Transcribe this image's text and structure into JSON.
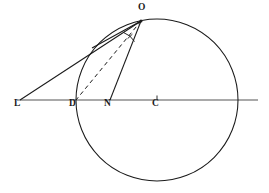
{
  "figure": {
    "width": 269,
    "height": 193,
    "background_color": "#ffffff",
    "stroke_color": "#1a1a1a",
    "axis_color": "#555555"
  },
  "labels": {
    "L": "L",
    "D": "D",
    "N": "N",
    "C": "C",
    "O": "O"
  },
  "geometry": {
    "circle": {
      "cx": 157,
      "cy": 100,
      "r": 81
    },
    "points": {
      "L": {
        "x": 20,
        "y": 100
      },
      "D": {
        "x": 76,
        "y": 100
      },
      "N": {
        "x": 110,
        "y": 100
      },
      "C": {
        "x": 157,
        "y": 100
      },
      "O": {
        "x": 141,
        "y": 21
      },
      "T": {
        "x": 92,
        "y": 48
      },
      "R": {
        "x": 238,
        "y": 100
      }
    },
    "baseline": {
      "x1": 17,
      "y1": 100,
      "x2": 258,
      "y2": 100
    },
    "segments": [
      {
        "name": "L-O",
        "from": "L",
        "to": "O",
        "style": "solid"
      },
      {
        "name": "O-N",
        "from": "O",
        "to": "N",
        "style": "solid"
      },
      {
        "name": "O-D",
        "from": "O",
        "to": "D",
        "style": "dashed"
      },
      {
        "name": "T-O-chord",
        "from": "T",
        "to": "O",
        "style": "solid"
      }
    ],
    "angle_marker": {
      "at": "O",
      "type": "arc-with-tick"
    },
    "center_tick": {
      "x": 157,
      "y": 100
    }
  },
  "label_positions": {
    "L": {
      "x": 14,
      "y": 104
    },
    "D": {
      "x": 69,
      "y": 104
    },
    "N": {
      "x": 104,
      "y": 104
    },
    "C": {
      "x": 152,
      "y": 104
    },
    "O": {
      "x": 138,
      "y": 4
    }
  }
}
